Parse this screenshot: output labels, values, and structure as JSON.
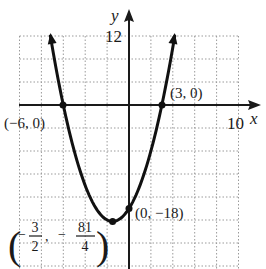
{
  "chart_data": {
    "type": "line",
    "title": "",
    "function": "y = x^2 + 3x - 18",
    "xlabel": "x",
    "ylabel": "y",
    "xlim": [
      -10,
      10
    ],
    "ylim": [
      -28,
      12
    ],
    "x_tick_label": "10",
    "y_tick_label": "12",
    "grid": true,
    "grid_spacing": {
      "x": 2,
      "y": 4
    },
    "series": [
      {
        "name": "parabola",
        "points": [
          {
            "x": -7.18,
            "y": 12
          },
          {
            "x": -6,
            "y": 0
          },
          {
            "x": -4,
            "y": -14
          },
          {
            "x": -3,
            "y": -18
          },
          {
            "x": -1.5,
            "y": -20.25
          },
          {
            "x": 0,
            "y": -18
          },
          {
            "x": 1,
            "y": -14
          },
          {
            "x": 3,
            "y": 0
          },
          {
            "x": 4.18,
            "y": 12
          }
        ]
      }
    ],
    "annotations": [
      {
        "label": "(−6, 0)",
        "x": -6,
        "y": 0
      },
      {
        "label": "(3, 0)",
        "x": 3,
        "y": 0
      },
      {
        "label": "(0, −18)",
        "x": 0,
        "y": -18
      },
      {
        "label": "(−3/2, −81/4)",
        "x": -1.5,
        "y": -20.25,
        "display": {
          "num1": "3",
          "den1": "2",
          "num2": "81",
          "den2": "4"
        }
      }
    ]
  },
  "labels": {
    "x_axis": "x",
    "y_axis": "y",
    "x_tick": "10",
    "y_tick": "12",
    "pt_neg6": "(−6, 0)",
    "pt_3": "(3, 0)",
    "pt_0": "(0, −18)",
    "vertex_open": "(",
    "vertex_close": ")",
    "vertex_num1": "3",
    "vertex_den1": "2",
    "vertex_num2": "81",
    "vertex_den2": "4",
    "vertex_minus": "−",
    "vertex_comma": ","
  }
}
